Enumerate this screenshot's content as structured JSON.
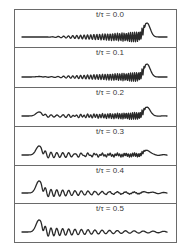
{
  "chart_data": {
    "type": "line",
    "title": "",
    "xlabel": "",
    "ylabel": "",
    "grid": false,
    "legend": "none",
    "layout": "6 stacked panels, shared frame",
    "panels": [
      {
        "label": "t/τ = 0.0",
        "t_over_tau": 0.0,
        "right_peak_amp": 14,
        "left_peak_amp": 0,
        "right_train_amp": 5.0,
        "left_train_amp": 0.0
      },
      {
        "label": "t/τ = 0.1",
        "t_over_tau": 0.1,
        "right_peak_amp": 13,
        "left_peak_amp": 0.5,
        "right_train_amp": 4.5,
        "left_train_amp": 0.3
      },
      {
        "label": "t/τ = 0.2",
        "t_over_tau": 0.2,
        "right_peak_amp": 9,
        "left_peak_amp": 4,
        "right_train_amp": 3.5,
        "left_train_amp": 1.5
      },
      {
        "label": "t/τ = 0.3",
        "t_over_tau": 0.3,
        "right_peak_amp": 5,
        "left_peak_amp": 9,
        "right_train_amp": 1.8,
        "left_train_amp": 3.5
      },
      {
        "label": "t/τ = 0.4",
        "t_over_tau": 0.4,
        "right_peak_amp": 1,
        "left_peak_amp": 12,
        "right_train_amp": 0.4,
        "left_train_amp": 4.5
      },
      {
        "label": "t/τ = 0.5",
        "t_over_tau": 0.5,
        "right_peak_amp": 0,
        "left_peak_amp": 12,
        "right_train_amp": 0.0,
        "left_train_amp": 5.0
      }
    ]
  },
  "frame": {
    "left": 14,
    "right": 176,
    "dividers_y": [
      9,
      47,
      87,
      126,
      165,
      203,
      242
    ]
  },
  "colors": {
    "line": "#2a2a2a",
    "frame": "#6a6a6a",
    "text": "#3a3a3a"
  }
}
